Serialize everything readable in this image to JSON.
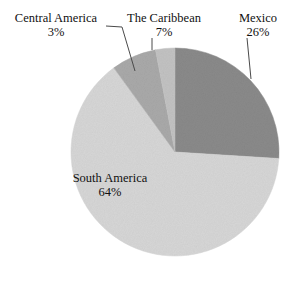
{
  "chart_data": {
    "type": "pie",
    "title": "",
    "subtitle": "",
    "xlabel": "",
    "ylabel": "",
    "legend_position": "none",
    "grid": false,
    "labels_inside": [
      "South America"
    ],
    "labels_outside": [
      "Central America",
      "The Caribbean",
      "Mexico"
    ],
    "categories": [
      "Mexico",
      "South America",
      "The Caribbean",
      "Central America"
    ],
    "values": [
      26,
      64,
      7,
      3
    ],
    "value_suffix": "%",
    "colors": [
      "#8a8a8a",
      "#d6d6d6",
      "#a9a9a9",
      "#c2c2c2"
    ],
    "start_angle_deg": 0,
    "direction": "clockwise",
    "slices": [
      {
        "name": "Mexico",
        "value": 26,
        "value_label": "26%",
        "color": "#8a8a8a",
        "start_deg": 0,
        "end_deg": 93.6
      },
      {
        "name": "South America",
        "value": 64,
        "value_label": "64%",
        "color": "#d6d6d6",
        "start_deg": 93.6,
        "end_deg": 324.0
      },
      {
        "name": "The Caribbean",
        "value": 7,
        "value_label": "7%",
        "color": "#a9a9a9",
        "start_deg": 324.0,
        "end_deg": 349.2
      },
      {
        "name": "Central America",
        "value": 3,
        "value_label": "3%",
        "color": "#c2c2c2",
        "start_deg": 349.2,
        "end_deg": 360.0
      }
    ]
  },
  "labels": {
    "central_america": {
      "name": "Central America",
      "percent": "3%"
    },
    "caribbean": {
      "name": "The Caribbean",
      "percent": "7%"
    },
    "mexico": {
      "name": "Mexico",
      "percent": "26%"
    },
    "south_america": {
      "name": "South America",
      "percent": "64%"
    }
  },
  "style": {
    "background": "#ffffff",
    "text_color": "#111111",
    "leader_line_color": "#4a4a4a"
  }
}
